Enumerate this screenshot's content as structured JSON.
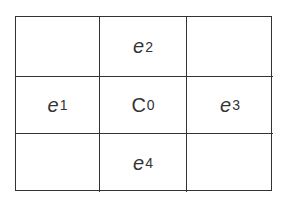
{
  "diagram": {
    "type": "3x3 stencil grid",
    "cells": [
      {
        "row": 0,
        "col": 0,
        "symbol": "",
        "subscript": "",
        "italic": false
      },
      {
        "row": 0,
        "col": 1,
        "symbol": "e",
        "subscript": "2",
        "italic": true
      },
      {
        "row": 0,
        "col": 2,
        "symbol": "",
        "subscript": "",
        "italic": false
      },
      {
        "row": 1,
        "col": 0,
        "symbol": "e",
        "subscript": "1",
        "italic": true
      },
      {
        "row": 1,
        "col": 1,
        "symbol": "C",
        "subscript": "0",
        "italic": false
      },
      {
        "row": 1,
        "col": 2,
        "symbol": "e",
        "subscript": "3",
        "italic": true
      },
      {
        "row": 2,
        "col": 0,
        "symbol": "",
        "subscript": "",
        "italic": false
      },
      {
        "row": 2,
        "col": 1,
        "symbol": "e",
        "subscript": "4",
        "italic": true
      },
      {
        "row": 2,
        "col": 2,
        "symbol": "",
        "subscript": "",
        "italic": false
      }
    ],
    "line_color": "#333333"
  }
}
